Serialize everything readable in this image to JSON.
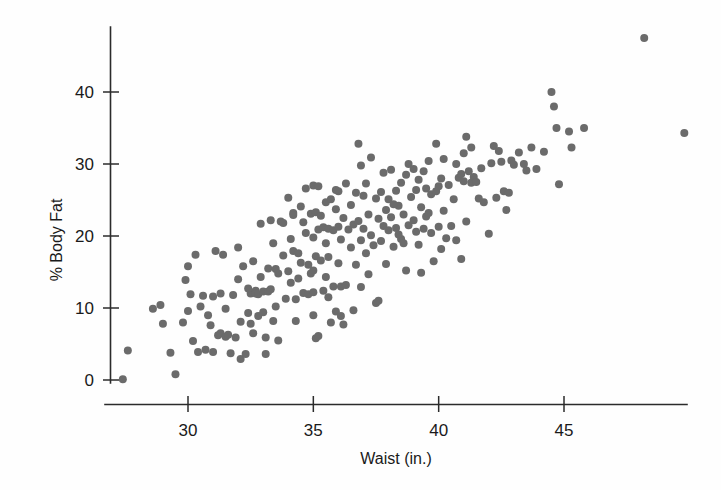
{
  "chart_data": {
    "type": "scatter",
    "title": "",
    "xlabel": "Waist (in.)",
    "ylabel": "% Body Fat",
    "xlim": [
      27.0,
      50.5
    ],
    "ylim": [
      -1.5,
      49.0
    ],
    "xticks": [
      30,
      35,
      40,
      45
    ],
    "yticks": [
      0,
      10,
      20,
      30,
      40
    ],
    "xtick_labels": [
      "30",
      "35",
      "40",
      "45"
    ],
    "ytick_labels": [
      "0",
      "10",
      "20",
      "30",
      "40"
    ],
    "grid": false,
    "legend": false,
    "marker_color": "#6b6b6b",
    "marker_size_px": 8,
    "n_points": 250,
    "series": [
      {
        "name": "Body fat vs waist",
        "points": [
          [
            27.4,
            0.1
          ],
          [
            27.6,
            4.1
          ],
          [
            28.6,
            9.9
          ],
          [
            28.9,
            10.4
          ],
          [
            29.0,
            7.8
          ],
          [
            29.3,
            3.8
          ],
          [
            29.5,
            0.8
          ],
          [
            29.9,
            13.9
          ],
          [
            30.0,
            15.8
          ],
          [
            30.0,
            9.6
          ],
          [
            30.1,
            11.9
          ],
          [
            30.2,
            5.4
          ],
          [
            30.3,
            17.4
          ],
          [
            30.4,
            3.9
          ],
          [
            30.6,
            11.7
          ],
          [
            30.8,
            9.0
          ],
          [
            30.9,
            7.6
          ],
          [
            31.0,
            11.6
          ],
          [
            31.1,
            17.9
          ],
          [
            31.2,
            6.2
          ],
          [
            31.3,
            6.5
          ],
          [
            31.4,
            17.4
          ],
          [
            31.5,
            9.9
          ],
          [
            31.5,
            6.0
          ],
          [
            31.6,
            6.3
          ],
          [
            31.7,
            3.7
          ],
          [
            31.8,
            11.8
          ],
          [
            31.9,
            5.9
          ],
          [
            32.0,
            18.4
          ],
          [
            32.0,
            14.0
          ],
          [
            32.1,
            8.1
          ],
          [
            32.1,
            2.9
          ],
          [
            32.2,
            15.8
          ],
          [
            32.3,
            3.6
          ],
          [
            32.4,
            9.3
          ],
          [
            32.5,
            12.0
          ],
          [
            32.5,
            7.8
          ],
          [
            32.6,
            16.5
          ],
          [
            32.7,
            12.4
          ],
          [
            32.7,
            12.0
          ],
          [
            32.8,
            11.9
          ],
          [
            32.8,
            8.9
          ],
          [
            32.9,
            21.7
          ],
          [
            32.9,
            14.3
          ],
          [
            33.0,
            12.3
          ],
          [
            33.0,
            9.4
          ],
          [
            33.1,
            5.9
          ],
          [
            33.1,
            3.6
          ],
          [
            33.2,
            15.5
          ],
          [
            33.2,
            12.3
          ],
          [
            33.3,
            22.2
          ],
          [
            33.3,
            12.6
          ],
          [
            33.4,
            8.2
          ],
          [
            33.5,
            15.4
          ],
          [
            33.5,
            10.2
          ],
          [
            33.6,
            5.5
          ],
          [
            33.7,
            22.0
          ],
          [
            33.8,
            17.3
          ],
          [
            33.9,
            11.3
          ],
          [
            34.0,
            25.3
          ],
          [
            34.0,
            15.1
          ],
          [
            34.1,
            19.6
          ],
          [
            34.1,
            13.5
          ],
          [
            34.2,
            23.2
          ],
          [
            34.2,
            17.9
          ],
          [
            34.3,
            11.2
          ],
          [
            34.3,
            8.2
          ],
          [
            34.4,
            14.1
          ],
          [
            34.5,
            24.1
          ],
          [
            34.5,
            16.3
          ],
          [
            34.6,
            12.1
          ],
          [
            34.7,
            26.6
          ],
          [
            34.7,
            20.4
          ],
          [
            34.8,
            16.0
          ],
          [
            34.8,
            11.9
          ],
          [
            34.9,
            23.1
          ],
          [
            34.9,
            14.8
          ],
          [
            35.0,
            27.0
          ],
          [
            35.0,
            19.8
          ],
          [
            35.0,
            15.2
          ],
          [
            35.0,
            12.2
          ],
          [
            35.0,
            9.0
          ],
          [
            35.1,
            23.3
          ],
          [
            35.1,
            17.2
          ],
          [
            35.1,
            5.8
          ],
          [
            35.2,
            26.9
          ],
          [
            35.2,
            20.9
          ],
          [
            35.3,
            22.8
          ],
          [
            35.3,
            16.6
          ],
          [
            35.4,
            21.2
          ],
          [
            35.5,
            24.7
          ],
          [
            35.5,
            19.0
          ],
          [
            35.5,
            14.3
          ],
          [
            35.6,
            21.0
          ],
          [
            35.6,
            17.1
          ],
          [
            35.7,
            25.1
          ],
          [
            35.7,
            8.0
          ],
          [
            35.8,
            20.8
          ],
          [
            35.8,
            13.0
          ],
          [
            35.9,
            23.7
          ],
          [
            35.9,
            9.5
          ],
          [
            36.0,
            26.2
          ],
          [
            36.0,
            21.3
          ],
          [
            36.0,
            16.2
          ],
          [
            36.1,
            19.5
          ],
          [
            36.1,
            13.0
          ],
          [
            36.2,
            22.5
          ],
          [
            36.2,
            7.7
          ],
          [
            36.3,
            27.3
          ],
          [
            36.4,
            20.9
          ],
          [
            36.5,
            24.3
          ],
          [
            36.5,
            18.4
          ],
          [
            36.6,
            21.6
          ],
          [
            36.7,
            26.0
          ],
          [
            36.7,
            16.0
          ],
          [
            36.8,
            32.8
          ],
          [
            36.8,
            22.1
          ],
          [
            36.9,
            29.8
          ],
          [
            36.9,
            19.4
          ],
          [
            37.0,
            25.6
          ],
          [
            37.0,
            21.0
          ],
          [
            37.1,
            27.3
          ],
          [
            37.1,
            17.6
          ],
          [
            37.2,
            23.0
          ],
          [
            37.2,
            14.7
          ],
          [
            37.3,
            30.9
          ],
          [
            37.3,
            20.1
          ],
          [
            37.4,
            18.7
          ],
          [
            37.5,
            25.2
          ],
          [
            37.5,
            10.7
          ],
          [
            37.6,
            22.4
          ],
          [
            37.7,
            26.1
          ],
          [
            37.7,
            19.3
          ],
          [
            37.8,
            28.8
          ],
          [
            37.8,
            21.4
          ],
          [
            37.9,
            16.1
          ],
          [
            38.0,
            25.1
          ],
          [
            38.0,
            20.8
          ],
          [
            38.1,
            29.2
          ],
          [
            38.1,
            22.6
          ],
          [
            38.2,
            18.5
          ],
          [
            38.3,
            26.3
          ],
          [
            38.3,
            21.1
          ],
          [
            38.4,
            24.2
          ],
          [
            38.5,
            27.4
          ],
          [
            38.5,
            19.6
          ],
          [
            38.6,
            23.0
          ],
          [
            38.7,
            28.5
          ],
          [
            38.7,
            15.2
          ],
          [
            38.8,
            30.0
          ],
          [
            38.8,
            21.5
          ],
          [
            38.9,
            25.4
          ],
          [
            39.0,
            29.3
          ],
          [
            39.0,
            22.2
          ],
          [
            39.1,
            26.4
          ],
          [
            39.1,
            20.6
          ],
          [
            39.2,
            27.8
          ],
          [
            39.2,
            18.8
          ],
          [
            39.3,
            24.0
          ],
          [
            39.4,
            29.0
          ],
          [
            39.4,
            21.0
          ],
          [
            39.5,
            26.6
          ],
          [
            39.5,
            22.7
          ],
          [
            39.6,
            30.4
          ],
          [
            39.7,
            20.4
          ],
          [
            39.7,
            25.8
          ],
          [
            39.8,
            16.5
          ],
          [
            39.9,
            32.8
          ],
          [
            39.9,
            26.2
          ],
          [
            40.0,
            21.3
          ],
          [
            40.1,
            28.0
          ],
          [
            40.1,
            18.2
          ],
          [
            40.2,
            30.7
          ],
          [
            40.2,
            23.5
          ],
          [
            40.3,
            19.7
          ],
          [
            40.4,
            27.1
          ],
          [
            40.5,
            21.4
          ],
          [
            40.6,
            25.1
          ],
          [
            40.7,
            30.0
          ],
          [
            40.7,
            19.4
          ],
          [
            40.8,
            28.1
          ],
          [
            40.9,
            16.8
          ],
          [
            41.0,
            31.5
          ],
          [
            41.0,
            27.6
          ],
          [
            41.1,
            33.8
          ],
          [
            41.2,
            29.0
          ],
          [
            41.3,
            32.3
          ],
          [
            41.3,
            27.4
          ],
          [
            41.4,
            28.2
          ],
          [
            41.5,
            27.5
          ],
          [
            41.6,
            25.2
          ],
          [
            41.7,
            29.4
          ],
          [
            41.8,
            24.7
          ],
          [
            42.0,
            20.3
          ],
          [
            42.1,
            30.1
          ],
          [
            42.2,
            32.5
          ],
          [
            42.3,
            25.3
          ],
          [
            42.4,
            31.8
          ],
          [
            42.5,
            30.3
          ],
          [
            42.6,
            26.2
          ],
          [
            42.7,
            23.6
          ],
          [
            42.9,
            30.5
          ],
          [
            43.0,
            29.9
          ],
          [
            43.2,
            31.6
          ],
          [
            43.4,
            30.0
          ],
          [
            43.5,
            29.1
          ],
          [
            43.7,
            32.3
          ],
          [
            44.5,
            40.0
          ],
          [
            44.6,
            38.0
          ],
          [
            44.7,
            35.0
          ],
          [
            44.8,
            27.2
          ],
          [
            45.2,
            34.5
          ],
          [
            45.3,
            32.3
          ],
          [
            45.8,
            35.0
          ],
          [
            48.2,
            47.5
          ],
          [
            49.8,
            34.3
          ],
          [
            30.5,
            10.2
          ],
          [
            31.0,
            3.9
          ],
          [
            33.4,
            19.0
          ],
          [
            34.6,
            21.9
          ],
          [
            35.4,
            12.4
          ],
          [
            36.3,
            13.2
          ],
          [
            37.6,
            11.0
          ],
          [
            38.2,
            24.4
          ],
          [
            39.3,
            14.9
          ],
          [
            34.2,
            22.9
          ],
          [
            35.9,
            26.4
          ],
          [
            33.8,
            21.8
          ],
          [
            32.4,
            12.7
          ],
          [
            31.3,
            12.0
          ],
          [
            36.6,
            9.7
          ],
          [
            37.9,
            23.6
          ],
          [
            38.6,
            19.0
          ],
          [
            39.6,
            23.2
          ],
          [
            40.0,
            26.9
          ],
          [
            41.1,
            22.0
          ],
          [
            34.4,
            17.6
          ],
          [
            33.6,
            14.8
          ],
          [
            32.6,
            6.5
          ],
          [
            35.2,
            6.1
          ],
          [
            36.1,
            8.9
          ],
          [
            30.7,
            4.2
          ],
          [
            29.8,
            8.0
          ],
          [
            38.4,
            20.2
          ],
          [
            40.9,
            28.6
          ],
          [
            42.8,
            26.0
          ],
          [
            43.9,
            29.3
          ],
          [
            44.2,
            31.7
          ],
          [
            35.6,
            11.5
          ],
          [
            36.9,
            12.9
          ]
        ]
      }
    ]
  },
  "axes": {
    "x_axis_name": "x-axis",
    "y_axis_name": "y-axis"
  }
}
